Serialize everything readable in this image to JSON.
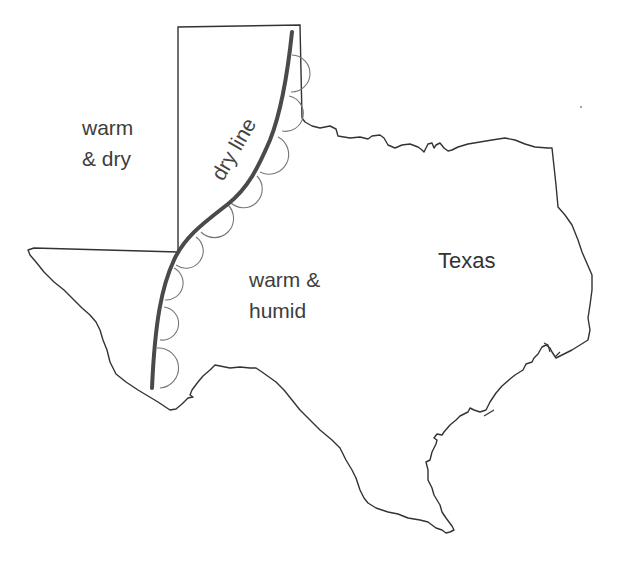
{
  "map": {
    "region": "Texas",
    "labels": {
      "warm_dry": [
        "warm",
        "& dry"
      ],
      "warm_humid": [
        "warm &",
        "humid"
      ],
      "state": "Texas",
      "dry_line": "dry line"
    },
    "colors": {
      "border": "#333333",
      "dry_line": "#4a4a4a",
      "scallops": "#666666",
      "text": "#3d3d3d",
      "background": "#ffffff"
    },
    "features": [
      {
        "name": "state-border",
        "type": "outline"
      },
      {
        "name": "oklahoma-panhandle-box",
        "type": "outline"
      },
      {
        "name": "dry-line",
        "type": "front",
        "symbol": "scalloped semicircles on humid (east) side"
      }
    ]
  }
}
